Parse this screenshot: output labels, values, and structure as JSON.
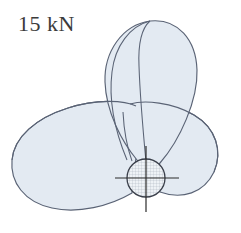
{
  "figure": {
    "label": {
      "text": "15 kN",
      "value": "15",
      "unit": "kN",
      "color": "#3b3b3b"
    },
    "colors": {
      "background": "#ffffff",
      "lobe_fill": "#e3eaf2",
      "lobe_stroke": "#5a6375",
      "hub_fill": "#eef2f6",
      "hub_stroke": "#3a3f4a",
      "hatch": "#98a2b3",
      "axis": "#2b2b2b"
    },
    "hub": {
      "center_x": 146,
      "center_y": 178,
      "radius": 19,
      "hatch_spacing": 3
    },
    "blades": [
      {
        "name": "top-blade",
        "angle_deg": 90,
        "tip_x": 152,
        "tip_y": 21
      },
      {
        "name": "left-blade",
        "angle_deg": 210,
        "tip_x": 13,
        "tip_y": 150
      },
      {
        "name": "right-blade",
        "angle_deg": 330,
        "tip_x": 218,
        "tip_y": 150
      }
    ],
    "axes": {
      "vertical": {
        "x": 146,
        "y1": 148,
        "y2": 210
      },
      "horizontal": {
        "y": 178,
        "x1": 117,
        "x2": 177
      }
    }
  }
}
